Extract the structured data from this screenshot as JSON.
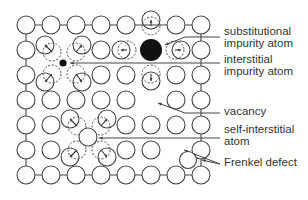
{
  "colors": {
    "stroke": "#444444",
    "fill_atom": "#ffffff",
    "impurity": "#111111",
    "text": "#333333"
  },
  "labels": {
    "substitutional_1": "substitutional",
    "substitutional_2": "impurity atom",
    "interstitial_1": "interstitial",
    "interstitial_2": "impurity atom",
    "vacancy": "vacancy",
    "self_interstitial_1": "self-interstitial",
    "self_interstitial_2": "atom",
    "frenkel": "Frenkel defect"
  },
  "lattice": {
    "columns": 8,
    "rows": 7,
    "origin": [
      26,
      25
    ],
    "spacing": 25,
    "atom_radius": 9
  },
  "defects": [
    {
      "type": "substitutional impurity atom",
      "position": [
        151,
        50
      ]
    },
    {
      "type": "interstitial impurity atom",
      "position": [
        63,
        63
      ]
    },
    {
      "type": "vacancy",
      "position": [
        151,
        100
      ]
    },
    {
      "type": "self-interstitial atom",
      "position": [
        88,
        137
      ]
    },
    {
      "type": "Frenkel defect",
      "vacancy": [
        176,
        150
      ],
      "interstitial": [
        188,
        160
      ]
    }
  ]
}
